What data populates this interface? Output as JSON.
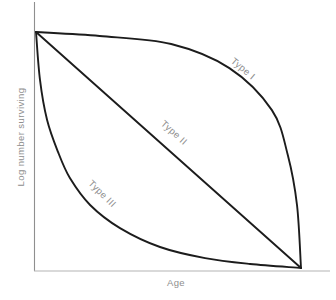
{
  "figure": {
    "background": "#ffffff",
    "curve_color": "#1c1c1c",
    "y_axis_color": "#8f8f8f",
    "x_axis_color": "#b3b3b3",
    "text_color": "#8e8e8e"
  },
  "labels": {
    "y_axis": "Log number surviving",
    "x_axis": "Age",
    "curve_1": "Type I",
    "curve_2": "Type II",
    "curve_3": "Type III"
  },
  "chart_data": {
    "type": "line",
    "xlabel": "Age",
    "ylabel": "Log number surviving",
    "x_ticks": [],
    "y_ticks": [],
    "x_range_normalized": [
      0,
      1
    ],
    "y_range_normalized": [
      0,
      1
    ],
    "legend_position": "labels-on-curves",
    "grid": false,
    "series": [
      {
        "name": "Type I",
        "x": [
          0,
          0.24,
          0.51,
          0.73,
          0.89,
          0.95,
          0.985,
          1
        ],
        "y": [
          1,
          0.983,
          0.949,
          0.847,
          0.669,
          0.479,
          0.267,
          0
        ]
      },
      {
        "name": "Type II",
        "x": [
          0,
          1
        ],
        "y": [
          1,
          0
        ]
      },
      {
        "name": "Type III",
        "x": [
          0,
          0.015,
          0.042,
          0.083,
          0.128,
          0.204,
          0.317,
          0.468,
          0.638,
          0.808,
          1
        ],
        "y": [
          1,
          0.797,
          0.627,
          0.492,
          0.381,
          0.267,
          0.169,
          0.089,
          0.042,
          0.017,
          0
        ]
      }
    ]
  }
}
